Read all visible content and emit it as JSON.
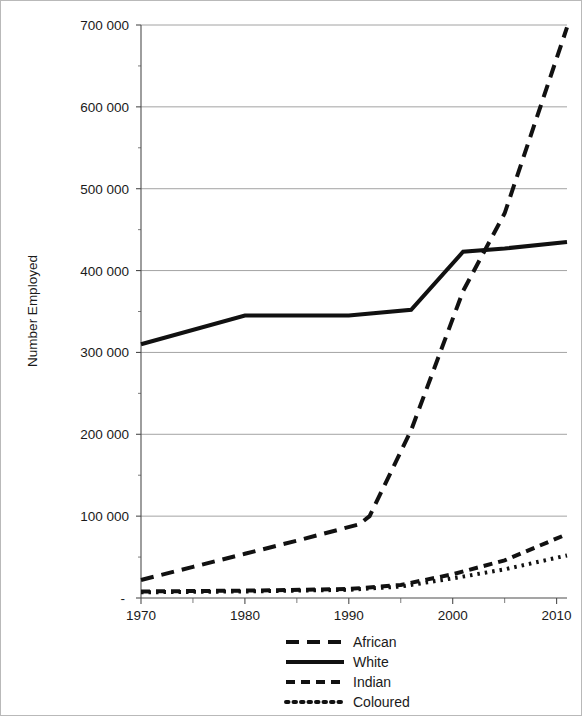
{
  "chart_data": {
    "type": "line",
    "title": "",
    "xlabel": "",
    "ylabel": "Number Employed",
    "xlim": [
      1970,
      2011
    ],
    "ylim": [
      0,
      700000
    ],
    "grid": true,
    "legend_position": "bottom",
    "y_ticks": [
      0,
      100000,
      200000,
      300000,
      400000,
      500000,
      600000,
      700000
    ],
    "y_tick_labels": [
      "-",
      "100 000",
      "200 000",
      "300 000",
      "400 000",
      "500 000",
      "600 000",
      "700 000"
    ],
    "x_ticks": [
      1970,
      1980,
      1990,
      2000,
      2010
    ],
    "x_tick_labels": [
      "1970",
      "1980",
      "1990",
      "2000",
      "2010"
    ],
    "x_minor_ticks": [
      1975,
      1985,
      1995,
      2005
    ],
    "series": [
      {
        "name": "African",
        "style": "long-dash",
        "dasharray": "13,8",
        "width": 4,
        "x": [
          1970,
          1975,
          1980,
          1985,
          1991,
          1992,
          1996,
          2001,
          2005,
          2011
        ],
        "values": [
          22000,
          38000,
          54000,
          70000,
          90000,
          100000,
          205000,
          375000,
          470000,
          697000
        ]
      },
      {
        "name": "White",
        "style": "solid",
        "dasharray": "none",
        "width": 4,
        "x": [
          1970,
          1980,
          1990,
          1996,
          2001,
          2005,
          2011
        ],
        "values": [
          310000,
          345000,
          345000,
          352000,
          423000,
          427000,
          435000
        ]
      },
      {
        "name": "Indian",
        "style": "dash",
        "dasharray": "9,6",
        "width": 4,
        "x": [
          1970,
          1980,
          1990,
          1995,
          2000,
          2005,
          2011
        ],
        "values": [
          8000,
          9000,
          11000,
          16000,
          29000,
          46000,
          78000
        ]
      },
      {
        "name": "Coloured",
        "style": "dotted",
        "dasharray": "2.5,5",
        "width": 4,
        "x": [
          1970,
          1980,
          1990,
          1995,
          2000,
          2005,
          2011
        ],
        "values": [
          7000,
          8000,
          10000,
          14000,
          24000,
          35000,
          52000
        ]
      }
    ],
    "legend": [
      {
        "label": "African",
        "style": "long-dash"
      },
      {
        "label": "White",
        "style": "solid"
      },
      {
        "label": "Indian",
        "style": "dash"
      },
      {
        "label": "Coloured",
        "style": "dotted"
      }
    ],
    "colors": {
      "series": "#111111",
      "gridline": "#8c8c8c",
      "axis": "#4d4d4d",
      "background": "#ffffff"
    }
  }
}
